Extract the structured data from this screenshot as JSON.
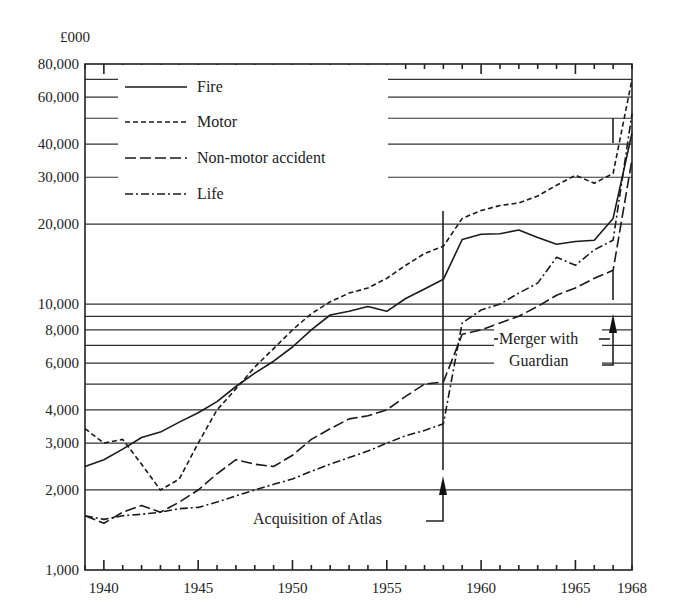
{
  "chart_data": {
    "type": "line",
    "title": "",
    "xlabel": "",
    "ylabel": "£000",
    "y_scale": "log",
    "ylim": [
      1000,
      80000
    ],
    "xlim": [
      1939,
      1968
    ],
    "grid": true,
    "legend_position": "upper-left",
    "y_ticks": [
      {
        "value": 1000,
        "label": "1,000"
      },
      {
        "value": 2000,
        "label": "2,000"
      },
      {
        "value": 3000,
        "label": "3,000"
      },
      {
        "value": 4000,
        "label": "4,000"
      },
      {
        "value": 6000,
        "label": "6,000"
      },
      {
        "value": 8000,
        "label": "8,000"
      },
      {
        "value": 10000,
        "label": "10,000"
      },
      {
        "value": 20000,
        "label": "20,000"
      },
      {
        "value": 30000,
        "label": "30,000"
      },
      {
        "value": 40000,
        "label": "40,000"
      },
      {
        "value": 60000,
        "label": "60,000"
      },
      {
        "value": 80000,
        "label": "80,000"
      }
    ],
    "y_gridlines": [
      2000,
      3000,
      4000,
      5000,
      6000,
      7000,
      8000,
      9000,
      10000,
      20000,
      30000,
      40000,
      50000,
      60000,
      70000
    ],
    "x_ticks": [
      {
        "value": 1940,
        "label": "1940"
      },
      {
        "value": 1945,
        "label": "1945"
      },
      {
        "value": 1950,
        "label": "1950"
      },
      {
        "value": 1955,
        "label": "1955"
      },
      {
        "value": 1960,
        "label": "1960"
      },
      {
        "value": 1965,
        "label": "1965"
      },
      {
        "value": 1968,
        "label": "1968"
      }
    ],
    "x": [
      1939,
      1940,
      1941,
      1942,
      1943,
      1944,
      1945,
      1946,
      1947,
      1948,
      1949,
      1950,
      1951,
      1952,
      1953,
      1954,
      1955,
      1956,
      1957,
      1958,
      1959,
      1960,
      1961,
      1962,
      1963,
      1964,
      1965,
      1966,
      1967,
      1968
    ],
    "series": [
      {
        "name": "Fire",
        "style": "solid",
        "values": [
          2450,
          2600,
          2850,
          3150,
          3300,
          3600,
          3900,
          4300,
          4900,
          5500,
          6100,
          6900,
          8000,
          9100,
          9400,
          9800,
          9400,
          10500,
          11400,
          12400,
          17500,
          18300,
          18400,
          19000,
          17800,
          16800,
          17200,
          17400,
          21000,
          44000
        ]
      },
      {
        "name": "Motor",
        "style": "short-dash",
        "values": [
          3400,
          3000,
          3100,
          2500,
          2000,
          2200,
          3000,
          4000,
          4800,
          5800,
          6800,
          8000,
          9200,
          10200,
          11000,
          11500,
          12500,
          14000,
          15500,
          16500,
          21000,
          22500,
          23500,
          24000,
          25500,
          28000,
          30500,
          28500,
          31000,
          70000
        ]
      },
      {
        "name": "Non-motor accident",
        "style": "long-dash",
        "values": [
          1600,
          1500,
          1650,
          1750,
          1650,
          1800,
          2000,
          2300,
          2600,
          2500,
          2450,
          2700,
          3100,
          3400,
          3700,
          3800,
          4000,
          4500,
          5000,
          5100,
          7700,
          8000,
          8500,
          9000,
          9800,
          10800,
          11500,
          12500,
          13400,
          35000
        ]
      },
      {
        "name": "Life",
        "style": "dash-dot",
        "values": [
          1600,
          1550,
          1600,
          1620,
          1650,
          1700,
          1720,
          1800,
          1900,
          2000,
          2100,
          2200,
          2350,
          2500,
          2650,
          2800,
          3000,
          3200,
          3350,
          3550,
          8500,
          9500,
          10000,
          11000,
          12000,
          15000,
          14000,
          16000,
          17400,
          52000
        ]
      }
    ],
    "annotations": [
      {
        "text": "Acquisition of Atlas",
        "x": 1958
      },
      {
        "text": "Merger with Guardian",
        "x": 1967
      }
    ]
  },
  "labels": {
    "unit": "£000",
    "legend": [
      "Fire",
      "Motor",
      "Non-motor accident",
      "Life"
    ],
    "acquisition": "Acquisition of Atlas",
    "merger_line1": "Merger with",
    "merger_line2": "Guardian"
  }
}
